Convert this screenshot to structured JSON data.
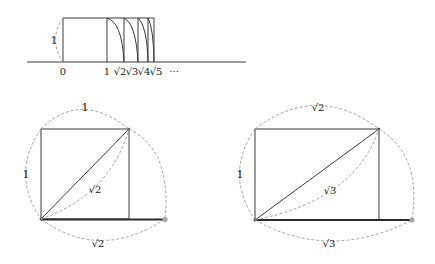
{
  "figure_top": {
    "axis_labels": [
      "0",
      "1",
      "√2",
      "√3",
      "√4",
      "√5",
      "⋯"
    ],
    "height_label": "1"
  },
  "figure_left": {
    "top_label": "1",
    "side_label": "1",
    "diagonal_label": "√2",
    "bottom_label": "√2"
  },
  "figure_right": {
    "top_label": "√2",
    "side_label": "1",
    "diagonal_label": "√3",
    "bottom_label": "√3"
  },
  "colors": {
    "line": "#3a3a3a",
    "dashed": "#9a9a9a",
    "dot": "#aaaaaa"
  }
}
